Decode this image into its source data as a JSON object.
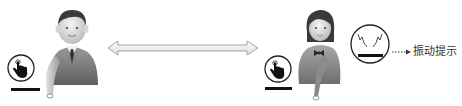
{
  "diagram": {
    "participants": [
      {
        "id": "left-user",
        "figure": "male",
        "icon": "touch-hand-icon"
      },
      {
        "id": "right-user",
        "figure": "female",
        "icon": "touch-hand-icon"
      }
    ],
    "connection": {
      "type": "bidirectional-arrow",
      "from": "left-user",
      "to": "right-user"
    },
    "vibration": {
      "icon": "vibration-icon",
      "connector": "dotted-arrow",
      "label": "振动提示"
    }
  },
  "colors": {
    "outline": "#222222",
    "bar": "#111111",
    "arrow_fill": "#f2f2f2",
    "arrow_stroke": "#999999",
    "text": "#333333"
  }
}
